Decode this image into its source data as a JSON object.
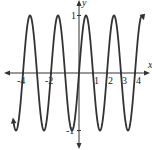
{
  "chart_data": {
    "type": "line",
    "title": "",
    "xlabel": "x",
    "ylabel": "y",
    "function": "y = sin(pi x)",
    "xlim": [
      -5.5,
      5
    ],
    "ylim": [
      -1.3,
      1.3
    ],
    "grid": false,
    "x_ticks": [
      -4,
      -2,
      1,
      2,
      3,
      4
    ],
    "x_tick_labels": [
      "-4",
      "-2",
      "1",
      "2",
      "3",
      "4"
    ],
    "y_ticks": [
      1,
      -1
    ],
    "y_tick_labels": [
      "1",
      "-1"
    ],
    "domain_plotted": [
      -4.7,
      4.6
    ],
    "series": [
      {
        "name": "sin(pi x)",
        "period": 2,
        "amplitude": 1,
        "color": "#333333"
      }
    ]
  },
  "labels": {
    "x_axis": "x",
    "y_axis": "y",
    "y_one": "1",
    "y_neg_one": "-1",
    "x_ticks": [
      "-4",
      "-2",
      "1",
      "2",
      "3",
      "4"
    ]
  }
}
